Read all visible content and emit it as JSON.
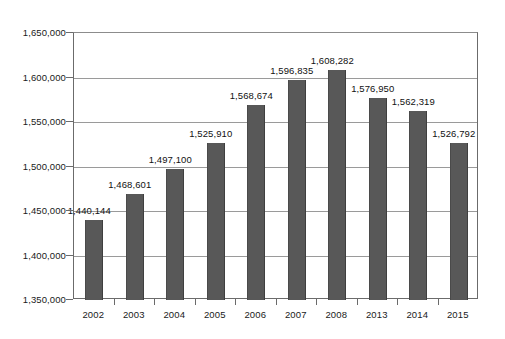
{
  "chart_data": {
    "type": "bar",
    "title": "",
    "subtitle": "",
    "xlabel": "",
    "ylabel": "",
    "categories": [
      "2002",
      "2003",
      "2004",
      "2005",
      "2006",
      "2007",
      "2008",
      "2013",
      "2014",
      "2015"
    ],
    "values": [
      1440144,
      1468601,
      1497100,
      1525910,
      1568674,
      1596835,
      1608282,
      1576950,
      1562319,
      1526792
    ],
    "data_labels": [
      "1,440,144",
      "1,468,601",
      "1,497,100",
      "1,525,910",
      "1,568,674",
      "1,596,835",
      "1,608,282",
      "1,576,950",
      "1,562,319",
      "1,526,792"
    ],
    "ylim": [
      1350000,
      1650000
    ],
    "ytick_values": [
      1350000,
      1400000,
      1450000,
      1500000,
      1550000,
      1600000,
      1650000
    ],
    "ytick_labels": [
      "1,350,000",
      "1,400,000",
      "1,450,000",
      "1,500,000",
      "1,550,000",
      "1,600,000",
      "1,650,000"
    ],
    "grid": true,
    "grid_axis": "y",
    "legend": false,
    "legend_position": "none",
    "series": [
      {
        "name": "",
        "values": [
          1440144,
          1468601,
          1497100,
          1525910,
          1568674,
          1596835,
          1608282,
          1576950,
          1562319,
          1526792
        ]
      }
    ],
    "colors": {
      "bar_fill": "#585858",
      "bar_edge": "#3f3f3f",
      "gridline": "#9a9a9a",
      "axis": "#6b6b6b",
      "text": "#1a1a1a",
      "background": "#ffffff"
    }
  }
}
